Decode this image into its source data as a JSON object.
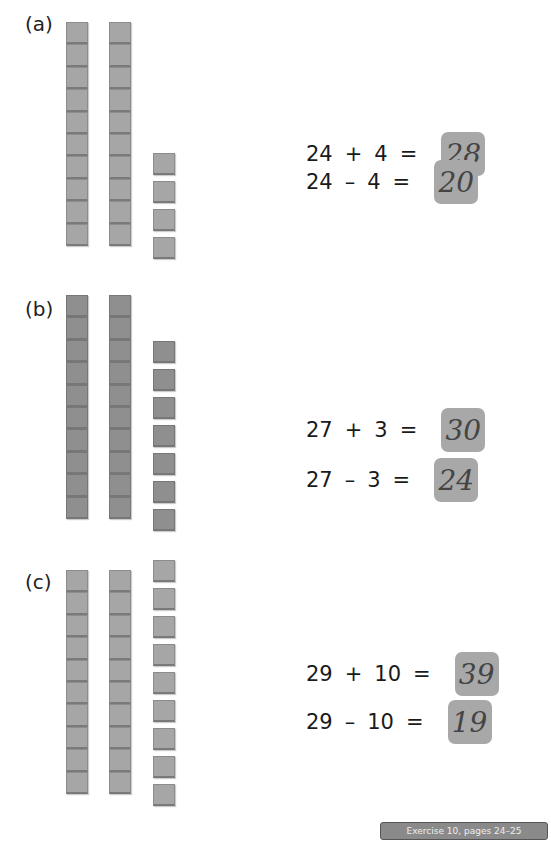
{
  "sections": [
    {
      "label": "(a)",
      "tens": 2,
      "ones": 4,
      "equations": [
        {
          "a": "24",
          "op": "+",
          "b": "4",
          "eq": "=",
          "answer": "28"
        },
        {
          "a": "24",
          "op": "–",
          "b": "4",
          "eq": "=",
          "answer": "20"
        }
      ]
    },
    {
      "label": "(b)",
      "tens": 2,
      "ones": 7,
      "equations": [
        {
          "a": "27",
          "op": "+",
          "b": "3",
          "eq": "=",
          "answer": "30"
        },
        {
          "a": "27",
          "op": "–",
          "b": "3",
          "eq": "=",
          "answer": "24"
        }
      ]
    },
    {
      "label": "(c)",
      "tens": 2,
      "ones": 9,
      "equations": [
        {
          "a": "29",
          "op": "+",
          "b": "10",
          "eq": "=",
          "answer": "39"
        },
        {
          "a": "29",
          "op": "–",
          "b": "10",
          "eq": "=",
          "answer": "19"
        }
      ]
    }
  ],
  "footer": {
    "text": "Exercise 10, pages 24–25"
  }
}
